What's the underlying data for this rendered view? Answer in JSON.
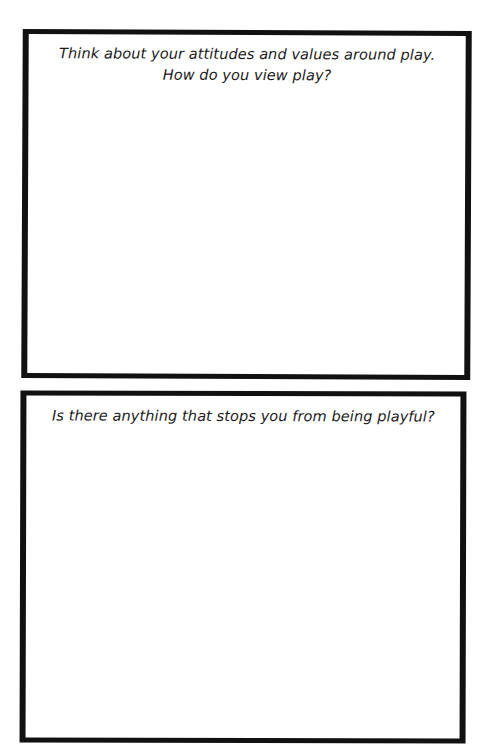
{
  "worksheet": {
    "boxes": [
      {
        "prompt_lines": [
          "Think about your attitudes and values around play.",
          "How do you view play?"
        ],
        "answer": ""
      },
      {
        "prompt_lines": [
          "Is there anything that stops you from being playful?"
        ],
        "answer": ""
      }
    ]
  },
  "colors": {
    "border": "#111111",
    "text": "#1a1a1a",
    "background": "#ffffff"
  }
}
